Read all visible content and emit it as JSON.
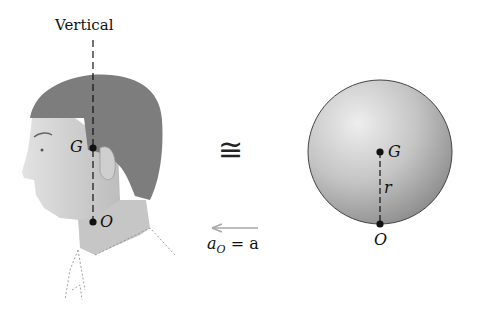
{
  "figure": {
    "left_panel": {
      "vertical_label": "Vertical",
      "head_center_label": "G",
      "neck_pivot_label": "O"
    },
    "middle": {
      "equivalence_symbol": "≅",
      "acceleration_label": "a",
      "acceleration_subscript": "O",
      "acceleration_rhs": "= a",
      "arrow_direction": "left"
    },
    "right_panel": {
      "center_label": "G",
      "radius_label": "r",
      "contact_label": "O"
    },
    "colors": {
      "hair": "#7a7a7a",
      "skin": "#c9c9c9",
      "sphere_light": "#e6e6e6",
      "sphere_dark": "#9a9a9a",
      "arrow": "#a8a8a8",
      "ink": "#111111"
    }
  }
}
